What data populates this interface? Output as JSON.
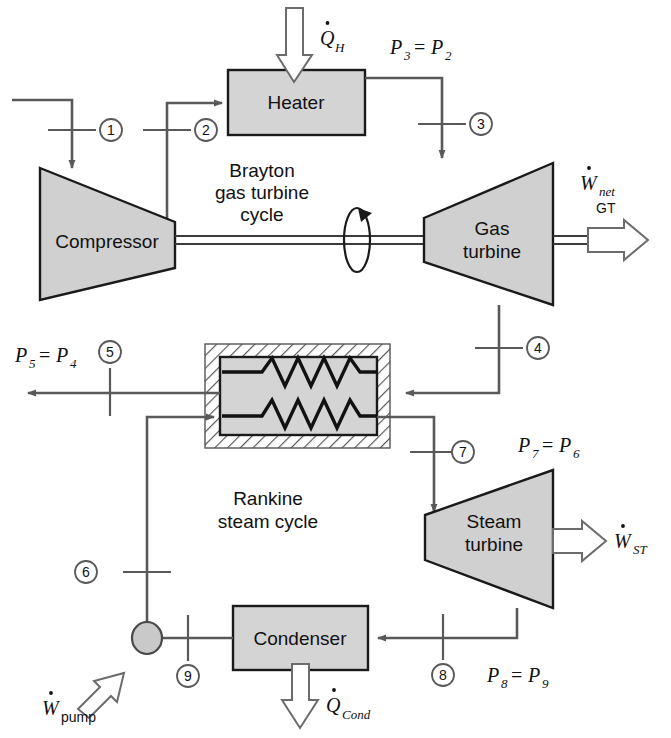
{
  "components": {
    "compressor": "Compressor",
    "heater": "Heater",
    "gas_turbine_line1": "Gas",
    "gas_turbine_line2": "turbine",
    "steam_turbine_line1": "Steam",
    "steam_turbine_line2": "turbine",
    "condenser": "Condenser",
    "heat_exchanger": ""
  },
  "cycle_labels": {
    "brayton_line1": "Brayton",
    "brayton_line2": "gas turbine",
    "brayton_line3": "cycle",
    "rankine_line1": "Rankine",
    "rankine_line2": "steam cycle"
  },
  "energy_labels": {
    "q_heater_sym": "Q",
    "q_heater_sub": "H",
    "w_net_sym": "W",
    "w_net_sub": "net",
    "w_net_sub2": "GT",
    "w_st_sym": "W",
    "w_st_sub": "ST",
    "w_pump_sym": "W",
    "w_pump_sub": "pump",
    "q_cond_sym": "Q",
    "q_cond_sub": "Cond"
  },
  "pressure_relations": [
    {
      "name": "p3-eq-p2",
      "left_sym": "P",
      "left_sub": "3",
      "op": "=",
      "right_sym": "P",
      "right_sub": "2"
    },
    {
      "name": "p5-eq-p4",
      "left_sym": "P",
      "left_sub": "5",
      "op": "=",
      "right_sym": "P",
      "right_sub": "4"
    },
    {
      "name": "p7-eq-p6",
      "left_sym": "P",
      "left_sub": "7",
      "op": "=",
      "right_sym": "P",
      "right_sub": "6"
    },
    {
      "name": "p8-eq-p9",
      "left_sym": "P",
      "left_sub": "8",
      "op": "=",
      "right_sym": "P",
      "right_sub": "9"
    }
  ],
  "state_points": [
    {
      "id": "1",
      "label": "1"
    },
    {
      "id": "2",
      "label": "2"
    },
    {
      "id": "3",
      "label": "3"
    },
    {
      "id": "4",
      "label": "4"
    },
    {
      "id": "5",
      "label": "5"
    },
    {
      "id": "6",
      "label": "6"
    },
    {
      "id": "7",
      "label": "7"
    },
    {
      "id": "8",
      "label": "8"
    },
    {
      "id": "9",
      "label": "9"
    }
  ],
  "colors": {
    "device_fill": "#d4d4d4",
    "device_stroke": "#1a1a1a",
    "flow_line": "#595959",
    "coil": "#111111",
    "background": "#ffffff"
  }
}
